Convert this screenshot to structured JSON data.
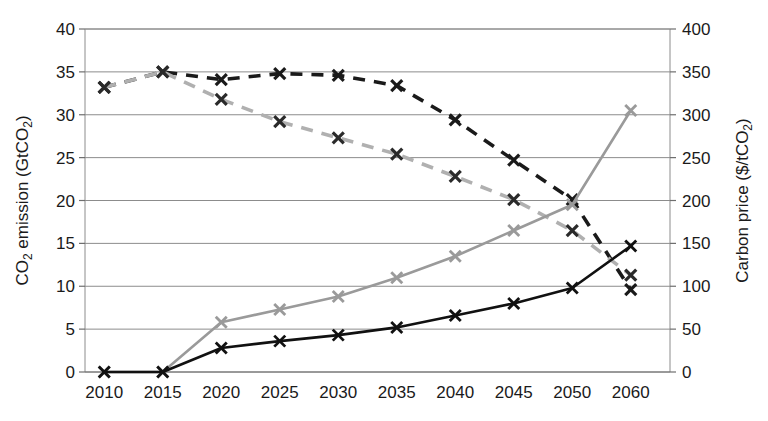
{
  "chart_data": {
    "type": "line",
    "title": "",
    "xlabel": "",
    "ylabel": "CO2 emission (GtCO2)",
    "y2label": "Carbon price ($/tCO2)",
    "ylabel_main": "CO",
    "ylabel_sub1": "2",
    "ylabel_mid": " emission (GtCO",
    "ylabel_sub2": "2",
    "ylabel_end": ")",
    "y2label_main": "Carbon price ($/tCO",
    "y2label_sub": "2",
    "y2label_end": ")",
    "categories": [
      "2010",
      "2015",
      "2020",
      "2025",
      "2030",
      "2035",
      "2040",
      "2045",
      "2050",
      "2060"
    ],
    "ylim": [
      0,
      40
    ],
    "yticks": [
      0,
      5,
      10,
      15,
      20,
      25,
      30,
      35,
      40
    ],
    "y2lim": [
      0,
      400
    ],
    "y2ticks": [
      0,
      50,
      100,
      150,
      200,
      250,
      300,
      350,
      400
    ],
    "grid": true,
    "legend": "none",
    "marker": "x",
    "series": [
      {
        "name": "CO2 emission - reference (dashed black)",
        "axis": "left",
        "style": "dashed",
        "color": "#1a1a1a",
        "values": [
          33.2,
          35.0,
          34.1,
          34.8,
          34.6,
          33.4,
          29.4,
          24.7,
          20.1,
          9.6
        ]
      },
      {
        "name": "CO2 emission - policy (dashed gray)",
        "axis": "left",
        "style": "dashed",
        "color": "#b0b0b0",
        "values": [
          33.2,
          35.0,
          31.8,
          29.2,
          27.3,
          25.4,
          22.8,
          20.1,
          16.5,
          11.3
        ]
      },
      {
        "name": "Carbon price - high (solid gray)",
        "axis": "right",
        "style": "solid",
        "color": "#9a9a9a",
        "values": [
          0,
          0,
          58,
          73,
          88,
          110,
          135,
          165,
          195,
          305
        ]
      },
      {
        "name": "Carbon price - low (solid black)",
        "axis": "right",
        "style": "solid",
        "color": "#111111",
        "values": [
          0,
          0,
          28,
          36,
          43,
          52,
          66,
          80,
          98,
          147
        ]
      }
    ]
  }
}
